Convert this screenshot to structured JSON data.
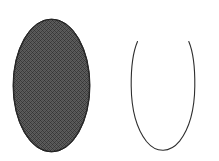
{
  "canvas": {
    "width": 219,
    "height": 161,
    "background_color": "#ffffff",
    "title": "Two ovoid shapes: one solid shaded, one open outline"
  },
  "palette": {
    "background": "#ffffff",
    "fill_dark_gray": "#4f4f4f",
    "fill_dither_dark": "#3a3a3a",
    "fill_dither_light": "#6e6e6e",
    "outline_stroke": "#2e2e2e",
    "shaded_edge": "#2a2a2a"
  },
  "shapes": [
    {
      "id": "shaded-ellipse",
      "name": "solid-shaded-ellipse",
      "role": "filled oval with halftone dither texture",
      "style": "filled",
      "fill": "#4f4f4f",
      "stroke": "#2a2a2a",
      "stroke_width": 1,
      "closed": true,
      "geometry": {
        "cx": 51.5,
        "cy": 85.5,
        "rx": 38.5,
        "ry": 66.5,
        "left": 13,
        "right": 90,
        "top": 19,
        "bottom": 152,
        "width": 77,
        "height": 133
      }
    },
    {
      "id": "open-outline-curve",
      "name": "open-outline-ovoid",
      "role": "unclosed oval outline with a gap at the top",
      "style": "outline",
      "fill": "none",
      "stroke": "#2e2e2e",
      "stroke_width": 1.1,
      "closed": false,
      "gap_location": "top",
      "geometry": {
        "cx": 163,
        "cy": 95,
        "rx": 32,
        "ry": 55,
        "left": 131,
        "right": 195,
        "top": 41,
        "bottom": 150,
        "width": 64,
        "height": 109,
        "gap_left_endpoint": [
          137,
          41
        ],
        "gap_right_endpoint": [
          189,
          41
        ],
        "gap_width": 52
      },
      "path": "M 137.5 41.5 C 133.0 52.0 131.0 68.0 131.2 86.0 C 131.4 108.0 136.0 128.0 146.5 141.5 C 152.0 148.2 158.0 150.4 163.2 150.3 C 168.4 150.2 174.2 147.8 179.6 141.2 C 190.0 127.6 194.6 107.6 194.8 86.0 C 195.0 68.0 193.2 52.0 188.8 41.5"
    }
  ],
  "labels": {
    "figure_caption": "",
    "shape_left_label": "",
    "shape_right_label": ""
  }
}
